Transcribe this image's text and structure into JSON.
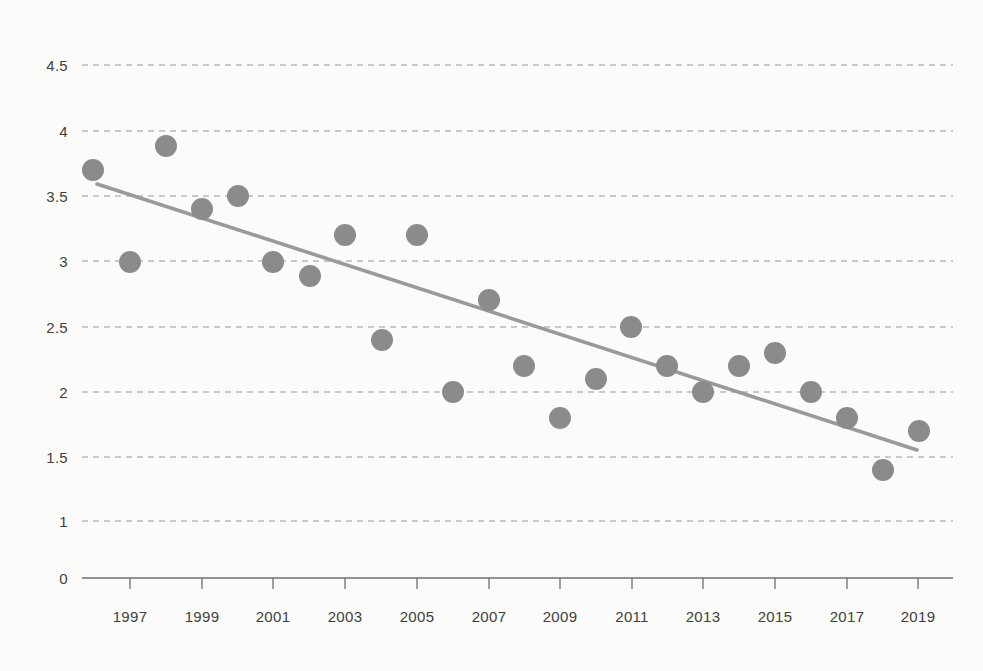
{
  "chart_data": {
    "type": "scatter",
    "title": "",
    "subtitle": "",
    "xlabel": "",
    "ylabel": "",
    "grid": true,
    "legend": null,
    "legend_position": "none",
    "xlim": [
      1995.6,
      2019.8
    ],
    "ylim": [
      0,
      4.5
    ],
    "x_tick_labels": [
      "1997",
      "1999",
      "2001",
      "2003",
      "2005",
      "2007",
      "2009",
      "2011",
      "2013",
      "2015",
      "2017",
      "2019"
    ],
    "x_ticks": [
      1997,
      1999,
      2001,
      2003,
      2005,
      2007,
      2009,
      2011,
      2013,
      2015,
      2017,
      2019
    ],
    "y_tick_labels": [
      "4.5",
      "4",
      "3.5",
      "3",
      "2.5",
      "2",
      "1.5",
      "1",
      "0"
    ],
    "y_ticks": [
      4.5,
      4,
      3.5,
      3,
      2.5,
      2,
      1.5,
      1,
      0
    ],
    "x": [
      1996,
      1997,
      1998,
      1999,
      2000,
      2001,
      2002,
      2003,
      2004,
      2005,
      2006,
      2007,
      2008,
      2009,
      2010,
      2011,
      2012,
      2013,
      2014,
      2015,
      2016,
      2017,
      2018,
      2019
    ],
    "values": [
      3.7,
      2.98,
      3.88,
      3.39,
      3.48,
      2.98,
      2.88,
      3.18,
      2.39,
      3.18,
      1.98,
      2.68,
      2.18,
      1.78,
      2.08,
      2.48,
      2.19,
      1.98,
      2.19,
      2.29,
      1.98,
      1.78,
      1.39,
      1.68
    ],
    "series": [
      {
        "name": "data-points",
        "type": "scatter",
        "marker": "circle",
        "color": "#8b8b8b",
        "points": [
          {
            "x": 1996,
            "y": 3.7
          },
          {
            "x": 1997,
            "y": 2.98
          },
          {
            "x": 1998,
            "y": 3.88
          },
          {
            "x": 1999,
            "y": 3.39
          },
          {
            "x": 2000,
            "y": 3.48
          },
          {
            "x": 2001,
            "y": 2.98
          },
          {
            "x": 2002,
            "y": 2.88
          },
          {
            "x": 2003,
            "y": 3.18
          },
          {
            "x": 2004,
            "y": 2.39
          },
          {
            "x": 2005,
            "y": 3.18
          },
          {
            "x": 2006,
            "y": 1.98
          },
          {
            "x": 2007,
            "y": 2.68
          },
          {
            "x": 2008,
            "y": 2.18
          },
          {
            "x": 2009,
            "y": 1.78
          },
          {
            "x": 2010,
            "y": 2.08
          },
          {
            "x": 2011,
            "y": 2.48
          },
          {
            "x": 2012,
            "y": 2.19
          },
          {
            "x": 2013,
            "y": 1.98
          },
          {
            "x": 2014,
            "y": 2.19
          },
          {
            "x": 2015,
            "y": 2.29
          },
          {
            "x": 2016,
            "y": 1.98
          },
          {
            "x": 2017,
            "y": 1.78
          },
          {
            "x": 2018,
            "y": 1.39
          },
          {
            "x": 2019,
            "y": 1.68
          }
        ]
      },
      {
        "name": "trend-line",
        "type": "line",
        "color": "#9a9a9a",
        "points": [
          {
            "x": 1996.1,
            "y": 3.59
          },
          {
            "x": 2019.0,
            "y": 1.55
          }
        ]
      }
    ]
  },
  "colors": {
    "background": "#fbfbfa",
    "marker": "#8b8b8b",
    "trend_line": "#9a9a9a",
    "gridline": "#b9b9b9",
    "axis": "#6f6f6f",
    "tick_text": "#3f3f41"
  },
  "geometry": {
    "gridlines_px": [
      {
        "label": "4.5",
        "y": 65
      },
      {
        "label": "4",
        "y": 131
      },
      {
        "label": "3.5",
        "y": 196
      },
      {
        "label": "3",
        "y": 261
      },
      {
        "label": "2.5",
        "y": 327
      },
      {
        "label": "2",
        "y": 392
      },
      {
        "label": "1.5",
        "y": 457
      },
      {
        "label": "1",
        "y": 521
      },
      {
        "label": "0",
        "y": 578
      }
    ],
    "x_ticks_px": [
      {
        "label": "1997",
        "x": 130
      },
      {
        "label": "1999",
        "x": 202
      },
      {
        "label": "2001",
        "x": 273
      },
      {
        "label": "2003",
        "x": 345
      },
      {
        "label": "2005",
        "x": 417
      },
      {
        "label": "2007",
        "x": 489
      },
      {
        "label": "2009",
        "x": 560
      },
      {
        "label": "2011",
        "x": 632
      },
      {
        "label": "2013",
        "x": 703
      },
      {
        "label": "2015",
        "x": 775
      },
      {
        "label": "2017",
        "x": 847
      },
      {
        "label": "2019",
        "x": 918
      }
    ],
    "points_px": [
      {
        "x": 93,
        "y": 170
      },
      {
        "x": 130,
        "y": 262
      },
      {
        "x": 166,
        "y": 146
      },
      {
        "x": 202,
        "y": 209
      },
      {
        "x": 238,
        "y": 196
      },
      {
        "x": 273,
        "y": 262
      },
      {
        "x": 310,
        "y": 276
      },
      {
        "x": 345,
        "y": 235
      },
      {
        "x": 382,
        "y": 340
      },
      {
        "x": 417,
        "y": 235
      },
      {
        "x": 453,
        "y": 392
      },
      {
        "x": 489,
        "y": 300
      },
      {
        "x": 524,
        "y": 366
      },
      {
        "x": 560,
        "y": 418
      },
      {
        "x": 596,
        "y": 379
      },
      {
        "x": 631,
        "y": 327
      },
      {
        "x": 667,
        "y": 366
      },
      {
        "x": 703,
        "y": 392
      },
      {
        "x": 739,
        "y": 366
      },
      {
        "x": 775,
        "y": 353
      },
      {
        "x": 811,
        "y": 392
      },
      {
        "x": 847,
        "y": 418
      },
      {
        "x": 883,
        "y": 470
      },
      {
        "x": 919,
        "y": 431
      }
    ],
    "trend_px": {
      "x1": 97,
      "y1": 184,
      "x2": 917,
      "y2": 450
    },
    "plot_left": 82,
    "plot_right": 953,
    "axis_y": 578,
    "tick_len": 11,
    "marker_radius": 11,
    "xlabel_y": 608
  }
}
